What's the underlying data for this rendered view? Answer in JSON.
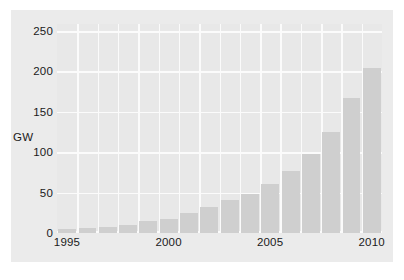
{
  "chart_data": {
    "type": "bar",
    "title": "",
    "subtitle": "",
    "xlabel": "",
    "ylabel": "GW",
    "categories": [
      "1995",
      "1996",
      "1997",
      "1998",
      "1999",
      "2000",
      "2001",
      "2002",
      "2003",
      "2004",
      "2005",
      "2006",
      "2007",
      "2008",
      "2009",
      "2010"
    ],
    "values": [
      5,
      6,
      7,
      10,
      14,
      17,
      24,
      31,
      39,
      47,
      59,
      74,
      94,
      121,
      161,
      197
    ],
    "x": [
      1995,
      1996,
      1997,
      1998,
      1999,
      2000,
      2001,
      2002,
      2003,
      2004,
      2005,
      2006,
      2007,
      2008,
      2009,
      2010
    ],
    "ylim": [
      0,
      250
    ],
    "xlim": [
      1994.5,
      2010.5
    ],
    "yticks": [
      0,
      50,
      100,
      150,
      200,
      250
    ],
    "ytick_labels": [
      "0",
      "50",
      "100",
      "150",
      "200",
      "250"
    ],
    "xticks": [
      1995,
      2000,
      2005,
      2010
    ],
    "xtick_labels": [
      "1995",
      "2000",
      "2005",
      "2010"
    ],
    "grid": true,
    "grid_axis": "both",
    "legend": null,
    "legend_position": "none",
    "annotations": [],
    "series": [
      {
        "name": "",
        "values": [
          5,
          6,
          7,
          10,
          14,
          17,
          24,
          31,
          39,
          47,
          59,
          74,
          94,
          121,
          161,
          197
        ]
      }
    ],
    "colors": {
      "bar_fill": "#cfcfcf",
      "plot_background": "#e8e8e8",
      "figure_background": "#ebebeb",
      "page_background": "#ffffff",
      "gridline": "#fbfbfb",
      "tick_text": "#1a1a1a"
    }
  }
}
